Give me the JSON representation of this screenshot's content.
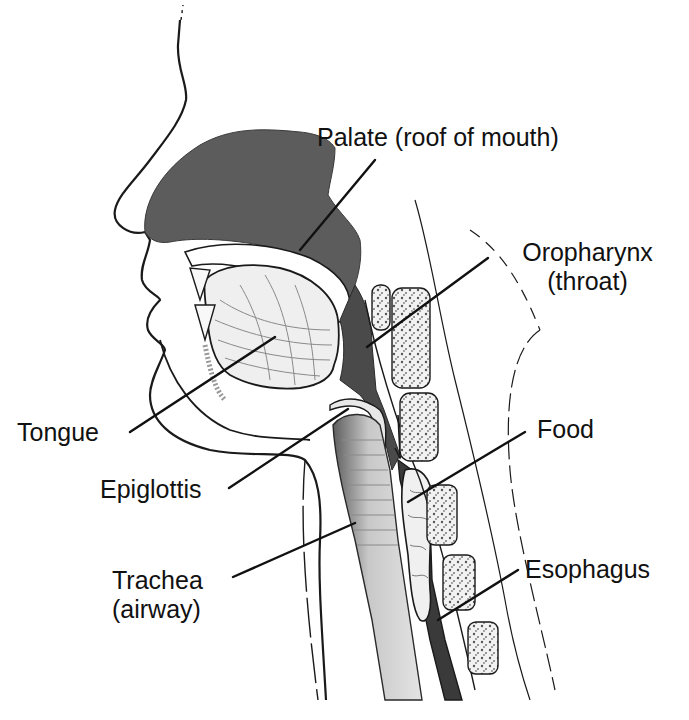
{
  "colors": {
    "outline": "#1a1a1a",
    "palate_fill": "#5c5c5c",
    "pharynx_fill": "#4a4a4a",
    "tongue_fill": "#ededed",
    "vertebra_fill": "#f4f4f4",
    "vertebra_speckle": "#6a6a6a",
    "trachea_fill": "#9a9a9a",
    "food_fill": "#f0f0f0",
    "leader_line": "#111111"
  },
  "labels": {
    "palate": "Palate (roof of mouth)",
    "oropharynx_line1": "Oropharynx",
    "oropharynx_line2": "(throat)",
    "tongue": "Tongue",
    "food": "Food",
    "epiglottis": "Epiglottis",
    "trachea_line1": "Trachea",
    "trachea_line2": "(airway)",
    "esophagus": "Esophagus"
  }
}
